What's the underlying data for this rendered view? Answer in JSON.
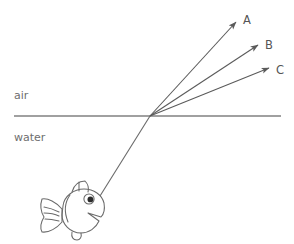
{
  "figure": {
    "background_color": "#ffffff",
    "width": 294,
    "height": 244
  },
  "media": {
    "upper_label": "air",
    "lower_label": "water",
    "label_color": "#6e6e6e",
    "interface": {
      "name": "air-water-interface",
      "color": "#808080",
      "x1": 14,
      "y1": 116,
      "x2": 281,
      "y2": 116,
      "stroke_width": 1.4
    }
  },
  "incident_ray": {
    "name": "incident-ray-from-fish",
    "color": "#6a6a6a",
    "from_x": 100,
    "from_y": 196,
    "to_x": 150,
    "to_y": 116,
    "stroke_width": 1.1
  },
  "rays": [
    {
      "id": "A",
      "label": "A",
      "color": "#5a5a5a",
      "origin_x": 150,
      "origin_y": 116,
      "tip_x": 236,
      "tip_y": 22,
      "label_x": 243,
      "label_y": 20
    },
    {
      "id": "B",
      "label": "B",
      "color": "#5a5a5a",
      "origin_x": 150,
      "origin_y": 116,
      "tip_x": 258,
      "tip_y": 45,
      "label_x": 265,
      "label_y": 45
    },
    {
      "id": "C",
      "label": "C",
      "color": "#5a5a5a",
      "origin_x": 150,
      "origin_y": 116,
      "tip_x": 269,
      "tip_y": 68,
      "label_x": 276,
      "label_y": 70
    }
  ],
  "fish": {
    "name": "fish-illustration",
    "outline_color": "#6a6a6a",
    "eye_color": "#2b2b2b",
    "center_x": 78,
    "center_y": 214
  }
}
